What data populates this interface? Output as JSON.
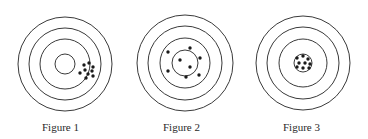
{
  "figures": [
    {
      "label": "Figure 1",
      "center": [
        65,
        64
      ],
      "rings": [
        47,
        36,
        25,
        10
      ],
      "dots": [
        [
          84,
          65
        ],
        [
          89,
          63
        ],
        [
          93,
          67
        ],
        [
          85,
          70
        ],
        [
          92,
          71
        ],
        [
          80,
          73
        ],
        [
          88,
          74
        ],
        [
          86,
          78
        ],
        [
          93,
          76
        ]
      ]
    },
    {
      "label": "Figure 2",
      "center": [
        185,
        63
      ],
      "rings": [
        48,
        37,
        25,
        13
      ],
      "dots": [
        [
          168,
          52
        ],
        [
          190,
          48
        ],
        [
          200,
          58
        ],
        [
          180,
          60
        ],
        [
          190,
          67
        ],
        [
          168,
          71
        ],
        [
          186,
          77
        ],
        [
          199,
          75
        ]
      ]
    },
    {
      "label": "Figure 3",
      "center": [
        303,
        63
      ],
      "rings": [
        47,
        36,
        24,
        9
      ],
      "dots": [
        [
          297,
          58
        ],
        [
          303,
          56
        ],
        [
          308,
          59
        ],
        [
          299,
          63
        ],
        [
          305,
          63
        ],
        [
          310,
          64
        ],
        [
          297,
          67
        ],
        [
          303,
          68
        ],
        [
          309,
          68
        ]
      ]
    }
  ],
  "colors": {
    "ring": "#3a3a3a",
    "dot": "#1a1a1a",
    "text": "#2a2a2a"
  }
}
